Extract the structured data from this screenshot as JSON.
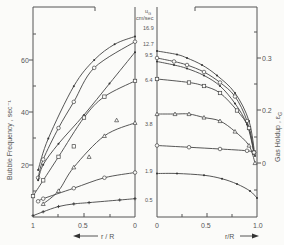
{
  "chart_data": [
    {
      "type": "line",
      "panel": "left",
      "title": "",
      "xlabel": "r / R",
      "xlabel_arrow": "left",
      "ylabel": "Bubble Frequency , sec⁻¹",
      "xlim": [
        1,
        0
      ],
      "ylim": [
        0,
        70
      ],
      "xticks": [
        "1",
        "0.5",
        "0"
      ],
      "yticks": [
        "20",
        "40",
        "60"
      ],
      "legend_title": "u_G cm/sec",
      "series": [
        {
          "name": "16.9",
          "marker": "dot",
          "x": [
            0.95,
            0.85,
            0.6,
            0.4,
            0.2,
            0
          ],
          "y": [
            18,
            30,
            50,
            60,
            66,
            69
          ]
        },
        {
          "name": "12.7",
          "marker": "circle",
          "x": [
            0.95,
            0.9,
            0.75,
            0.6,
            0.4,
            0
          ],
          "y": [
            15,
            22,
            34,
            44,
            57,
            67
          ]
        },
        {
          "name": "9.5",
          "marker": "dot",
          "x": [
            0.95,
            0.9,
            0.75,
            0.5,
            0.25,
            0
          ],
          "y": [
            14,
            20,
            28,
            39,
            51,
            63
          ]
        },
        {
          "name": "6.4",
          "marker": "square",
          "x": [
            1.0,
            0.9,
            0.75,
            0.5,
            0.3,
            0
          ],
          "y": [
            8,
            14,
            23,
            38,
            46,
            52
          ]
        },
        {
          "name": "3.8",
          "marker": "triangle",
          "x": [
            0.9,
            0.75,
            0.6,
            0.3,
            0
          ],
          "y": [
            5,
            10,
            19,
            31,
            36
          ]
        },
        {
          "name": "1.9",
          "marker": "circle",
          "x": [
            0.95,
            0.9,
            0.6,
            0.3,
            0
          ],
          "y": [
            6,
            7,
            11,
            15,
            17
          ]
        },
        {
          "name": "0.5",
          "marker": "plus",
          "x": [
            1.0,
            0.9,
            0.75,
            0.6,
            0.45,
            0.15,
            0
          ],
          "y": [
            0.5,
            2,
            4,
            5,
            5.5,
            6.5,
            7
          ]
        }
      ],
      "stray_points": [
        {
          "x": 0.6,
          "y": 27,
          "marker": "square"
        },
        {
          "x": 0.45,
          "y": 23,
          "marker": "triangle"
        },
        {
          "x": 0.18,
          "y": 37,
          "marker": "triangle"
        }
      ]
    },
    {
      "type": "line",
      "panel": "right",
      "title": "",
      "xlabel": "r/R",
      "xlabel_arrow": "right",
      "ylabel": "Gas Holdup , ε_G",
      "xlim": [
        0,
        1.0
      ],
      "ylim": [
        -0.1,
        0.35
      ],
      "xticks": [
        "0",
        "0.5",
        "1.0"
      ],
      "yticks": [
        "0",
        "0.2",
        "0.3"
      ],
      "series": [
        {
          "name": "16.9",
          "marker": "dot",
          "x": [
            0,
            0.2,
            0.3,
            0.45,
            0.6,
            0.78,
            0.92,
            0.98
          ],
          "y": [
            0.32,
            0.31,
            0.3,
            0.28,
            0.25,
            0.2,
            0.12,
            0.02
          ]
        },
        {
          "name": "12.7",
          "marker": "circle",
          "x": [
            0,
            0.17,
            0.3,
            0.47,
            0.63,
            0.78,
            0.9,
            0.97
          ],
          "y": [
            0.3,
            0.29,
            0.28,
            0.26,
            0.23,
            0.19,
            0.12,
            0.03
          ]
        },
        {
          "name": "9.5",
          "marker": "dot",
          "x": [
            0,
            0.17,
            0.3,
            0.47,
            0.63,
            0.78,
            0.9,
            0.97
          ],
          "y": [
            0.29,
            0.28,
            0.27,
            0.25,
            0.22,
            0.17,
            0.11,
            0.03
          ]
        },
        {
          "name": "6.4",
          "marker": "square",
          "x": [
            0,
            0.32,
            0.47,
            0.63,
            0.8,
            0.92,
            0.97
          ],
          "y": [
            0.24,
            0.23,
            0.22,
            0.2,
            0.15,
            0.1,
            0.03
          ]
        },
        {
          "name": "3.8",
          "marker": "triangle",
          "x": [
            0,
            0.18,
            0.32,
            0.47,
            0.63,
            0.78,
            0.92,
            0.98
          ],
          "y": [
            0.14,
            0.14,
            0.14,
            0.13,
            0.12,
            0.09,
            0.05,
            0.0
          ]
        },
        {
          "name": "1.9",
          "marker": "circle",
          "x": [
            0,
            0.32,
            0.63,
            0.9,
            0.97
          ],
          "y": [
            0.05,
            0.045,
            0.04,
            0.035,
            0.03
          ]
        },
        {
          "name": "0.5",
          "marker": "dot",
          "x": [
            0,
            0.2,
            0.47,
            0.65,
            0.8,
            0.93,
            1.0
          ],
          "y": [
            -0.03,
            -0.03,
            -0.035,
            -0.045,
            -0.06,
            -0.08,
            -0.1
          ]
        }
      ]
    }
  ],
  "labels": {
    "left_ylabel": "Bubble Frequency ,  sec⁻¹",
    "right_ylabel": "Gas Holdup ,  ε",
    "right_ylabel_sub": "G",
    "left_xlabel": "r / R",
    "right_xlabel": "r/R",
    "legend_title_top": "u",
    "legend_title_sub": "G",
    "legend_unit": "cm/sec",
    "legend_values": [
      "16.9",
      "12.7",
      "9.5",
      "6.4",
      "3.8",
      "1.9",
      "0.5"
    ],
    "left_xticks": [
      "1",
      "0.5",
      "0"
    ],
    "right_xticks": [
      "0",
      "0.5",
      "1.0"
    ],
    "left_yticks": [
      "60",
      "40",
      "20"
    ],
    "right_yticks": [
      "0.3",
      "0.2",
      "0"
    ]
  }
}
